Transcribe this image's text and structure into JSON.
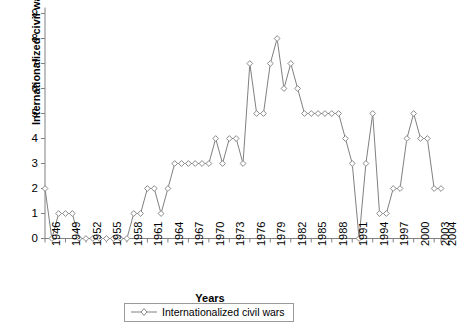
{
  "chart_data": {
    "type": "line",
    "title": "",
    "xlabel": "Years",
    "ylabel": "Internationalized civil wars",
    "legend": [
      "Internationalized civil wars"
    ],
    "legend_position": "bottom-center",
    "grid": false,
    "ylim": [
      0,
      9
    ],
    "yticks": [
      0,
      1,
      2,
      3,
      4,
      5,
      6,
      7,
      8,
      9
    ],
    "xtick_labels": [
      "1946",
      "1949",
      "1952",
      "1955",
      "1958",
      "1961",
      "1964",
      "1967",
      "1970",
      "1973",
      "1976",
      "1979",
      "1982",
      "1985",
      "1988",
      "1991",
      "1994",
      "1997",
      "2000",
      "2003",
      "2004"
    ],
    "marker": "open-diamond",
    "line_color": "#808080",
    "marker_color": "#8a8a8a",
    "axis_color": "#808080",
    "x": [
      1946,
      1947,
      1948,
      1949,
      1950,
      1951,
      1952,
      1953,
      1954,
      1955,
      1956,
      1957,
      1958,
      1959,
      1960,
      1961,
      1962,
      1963,
      1964,
      1965,
      1966,
      1967,
      1968,
      1969,
      1970,
      1971,
      1972,
      1973,
      1974,
      1975,
      1976,
      1977,
      1978,
      1979,
      1980,
      1981,
      1982,
      1983,
      1984,
      1985,
      1986,
      1987,
      1988,
      1989,
      1990,
      1991,
      1992,
      1993,
      1994,
      1995,
      1996,
      1997,
      1998,
      1999,
      2000,
      2001,
      2002,
      2003,
      2004
    ],
    "values": [
      2,
      0,
      1,
      1,
      1,
      0,
      0,
      0,
      0,
      0,
      0,
      0,
      0,
      1,
      1,
      2,
      2,
      1,
      2,
      3,
      3,
      3,
      3,
      3,
      3,
      4,
      3,
      4,
      4,
      3,
      7,
      5,
      5,
      7,
      8,
      6,
      7,
      6,
      5,
      5,
      5,
      5,
      5,
      5,
      4,
      3,
      0,
      3,
      5,
      1,
      1,
      2,
      2,
      4,
      5,
      4,
      4,
      2,
      2
    ],
    "series": [
      {
        "name": "Internationalized civil wars",
        "values": [
          2,
          0,
          1,
          1,
          1,
          0,
          0,
          0,
          0,
          0,
          0,
          0,
          0,
          1,
          1,
          2,
          2,
          1,
          2,
          3,
          3,
          3,
          3,
          3,
          3,
          4,
          3,
          4,
          4,
          3,
          7,
          5,
          5,
          7,
          8,
          6,
          7,
          6,
          5,
          5,
          5,
          5,
          5,
          5,
          4,
          3,
          0,
          3,
          5,
          1,
          1,
          2,
          2,
          4,
          5,
          4,
          4,
          2,
          2
        ]
      }
    ]
  },
  "legend_label": "Internationalized civil wars"
}
